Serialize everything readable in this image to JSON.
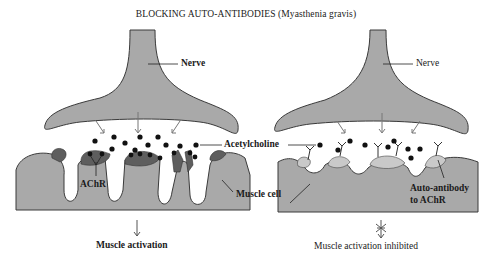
{
  "title": "BLOCKING AUTO-ANTIBODIES (Myasthenia gravis)",
  "colors": {
    "tissue": "#a9a9a9",
    "receptor": "#5e5e5e",
    "outline": "#3a3a3a",
    "molecule": "#111111",
    "background": "#ffffff"
  },
  "left_panel": {
    "nerve_label": "Nerve",
    "receptor_label": "AChR",
    "outcome": "Muscle activation",
    "outcome_arrow": "down-arrow"
  },
  "shared": {
    "acetylcholine_label": "Acetylcholine",
    "muscle_cell_label": "Muscle cell"
  },
  "right_panel": {
    "nerve_label": "Nerve",
    "antibody_label_line1": "Auto-antibody",
    "antibody_label_line2": "to AChR",
    "outcome": "Muscle activation inhibited",
    "outcome_arrow": "blocked-arrow"
  }
}
